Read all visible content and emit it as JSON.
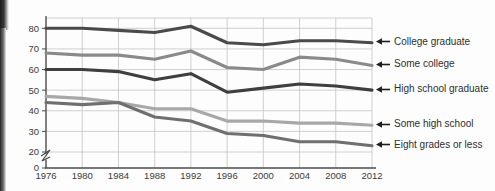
{
  "chart_data": {
    "type": "line",
    "title": "",
    "subtitle": "",
    "xlabel": "",
    "ylabel": "",
    "x": [
      1976,
      1980,
      1984,
      1988,
      1992,
      1996,
      2000,
      2004,
      2008,
      2012
    ],
    "xtick_labels": [
      "1976",
      "1980",
      "1984",
      "1988",
      "1992",
      "1996",
      "2000",
      "2004",
      "2008",
      "2012"
    ],
    "ytick_labels": [
      "0",
      "20",
      "30",
      "40",
      "50",
      "60",
      "70",
      "80"
    ],
    "yticks": [
      0,
      20,
      30,
      40,
      50,
      60,
      70,
      80
    ],
    "ylim": [
      20,
      85
    ],
    "axis_break": true,
    "axis_break_between": [
      0,
      20
    ],
    "grid": true,
    "legend_position": "right",
    "series": [
      {
        "name": "College graduate",
        "color": "#4a4a4a",
        "values": [
          80,
          80,
          79,
          78,
          81,
          73,
          72,
          74,
          74,
          73
        ]
      },
      {
        "name": "Some college",
        "color": "#8a8a8a",
        "values": [
          68,
          67,
          67,
          65,
          69,
          61,
          60,
          66,
          65,
          62
        ]
      },
      {
        "name": "High school graduate",
        "color": "#3f3f3f",
        "values": [
          60,
          60,
          59,
          55,
          58,
          49,
          51,
          53,
          52,
          50
        ]
      },
      {
        "name": "Some high school",
        "color": "#a8a8a8",
        "values": [
          47,
          46,
          44,
          41,
          41,
          35,
          35,
          34,
          34,
          33
        ]
      },
      {
        "name": "Eight grades or less",
        "color": "#6f6f6f",
        "values": [
          44,
          43,
          44,
          37,
          35,
          29,
          28,
          25,
          25,
          23
        ]
      }
    ]
  },
  "legend": {
    "arrow_icon": "arrow-left-icon",
    "items": [
      {
        "label": "College graduate"
      },
      {
        "label": "Some college"
      },
      {
        "label": "High school graduate"
      },
      {
        "label": "Some high school"
      },
      {
        "label": "Eight grades or less"
      }
    ]
  }
}
